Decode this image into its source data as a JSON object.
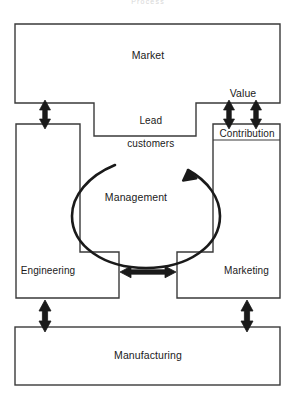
{
  "diagram": {
    "title": "Process",
    "title_visible": "Process",
    "nodes": {
      "market": {
        "label": "Market"
      },
      "lead_customers": {
        "label": "Lead\ncustomers",
        "line1": "Lead",
        "line2": "customers"
      },
      "value": {
        "label": "Value"
      },
      "contribution": {
        "label": "Contribution"
      },
      "management": {
        "label": "Management"
      },
      "engineering": {
        "label": "Engineering"
      },
      "marketing": {
        "label": "Marketing"
      },
      "manufacturing": {
        "label": "Manufacturing"
      }
    },
    "connectors": [
      {
        "name": "market-to-engineering",
        "type": "double-arrow-vertical"
      },
      {
        "name": "market-to-contribution-left",
        "type": "double-arrow-vertical"
      },
      {
        "name": "market-to-contribution-right",
        "type": "double-arrow-vertical"
      },
      {
        "name": "engineering-to-marketing",
        "type": "double-arrow-horizontal"
      },
      {
        "name": "engineering-to-manufacturing",
        "type": "double-arrow-vertical"
      },
      {
        "name": "marketing-to-manufacturing",
        "type": "double-arrow-vertical"
      },
      {
        "name": "management-cycle",
        "type": "circular-arrow-counterclockwise"
      }
    ],
    "colors": {
      "stroke": "#3a3a3a",
      "arrow_fill": "#1a1a1a",
      "background": "#ffffff",
      "text": "#1a1a1a",
      "title_text": "#d8d8d8"
    }
  }
}
